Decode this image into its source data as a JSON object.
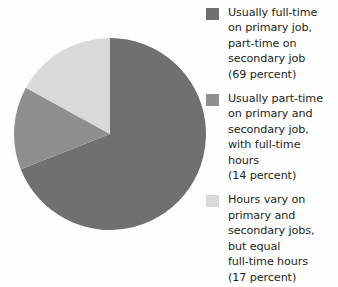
{
  "chart_data": {
    "type": "pie",
    "title": "",
    "subtitle": "",
    "xlabel": "",
    "ylabel": "",
    "grid": false,
    "legend_position": "right",
    "units": "percent",
    "start_angle_deg": 0,
    "direction": "clockwise",
    "categories": [
      "Usually full-time on primary job, part-time on secondary job",
      "Usually part-time on primary and secondary job, with full-time hours",
      "Hours vary on primary and secondary jobs, but equal full-time hours"
    ],
    "values": [
      69,
      14,
      17
    ],
    "slices": [
      {
        "label": "Usually full-time\non primary job,\npart-time on\nsecondary job\n(69 percent)",
        "value": 69,
        "value_text": "(69 percent)",
        "color": "#707070"
      },
      {
        "label": "Usually part-time\non primary and\nsecondary job,\nwith full-time\nhours\n(14 percent)",
        "value": 14,
        "value_text": "(14 percent)",
        "color": "#8f8f8f"
      },
      {
        "label": "Hours vary on\nprimary and\nsecondary jobs,\nbut equal\nfull-time hours\n(17 percent)",
        "value": 17,
        "value_text": "(17 percent)",
        "color": "#d9d9d9"
      }
    ]
  },
  "legend": {
    "entries": [
      {
        "swatch_name": "legend-swatch-full-time-primary",
        "color": "#707070",
        "text": "Usually full-time\non primary job,\npart-time on\nsecondary job\n(69 percent)"
      },
      {
        "swatch_name": "legend-swatch-part-time-both",
        "color": "#8f8f8f",
        "text": "Usually part-time\non primary and\nsecondary job,\nwith full-time\nhours\n(14 percent)"
      },
      {
        "swatch_name": "legend-swatch-hours-vary",
        "color": "#d9d9d9",
        "text": "Hours vary on\nprimary and\nsecondary jobs,\nbut equal\nfull-time hours\n(17 percent)"
      }
    ]
  },
  "colors": {
    "background": "#fefefe",
    "text": "#231f20",
    "slice_1": "#707070",
    "slice_2": "#8f8f8f",
    "slice_3": "#d9d9d9"
  }
}
